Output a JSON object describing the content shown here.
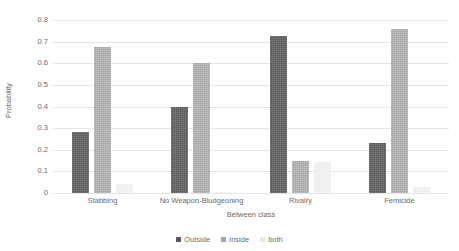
{
  "chart_data": {
    "type": "bar",
    "title": "",
    "xlabel": "Between class",
    "ylabel": "Probability",
    "categories": [
      "Stabbing",
      "No Weapon-Bludgeoning",
      "Rivalry",
      "Femicide"
    ],
    "series": [
      {
        "name": "Outside",
        "color": "#595959",
        "values": [
          0.28,
          0.4,
          0.725,
          0.23
        ]
      },
      {
        "name": "Inside",
        "color": "#a6a6a6",
        "values": [
          0.675,
          0.6,
          0.15,
          0.76
        ]
      },
      {
        "name": "both",
        "color": "#e9e9e9",
        "values": [
          0.04,
          0.005,
          0.145,
          0.03
        ]
      }
    ],
    "ylim": [
      0,
      0.8
    ],
    "yticks": [
      "0",
      "0.1",
      "0.2",
      "0.3",
      "0.4",
      "0.5",
      "0.6",
      "0.7",
      "0.8"
    ],
    "ytick_values": [
      0,
      0.1,
      0.2,
      0.3,
      0.4,
      0.5,
      0.6,
      0.7,
      0.8
    ],
    "grid": true,
    "legend_position": "bottom-center"
  },
  "axes": {
    "y_title": "Probability",
    "x_title": "Between class"
  },
  "legend": {
    "items": [
      {
        "label": "Outside",
        "color": "#595959"
      },
      {
        "label": "Inside",
        "color": "#a6a6a6"
      },
      {
        "label": "both",
        "color": "#e9e9e9"
      }
    ]
  }
}
